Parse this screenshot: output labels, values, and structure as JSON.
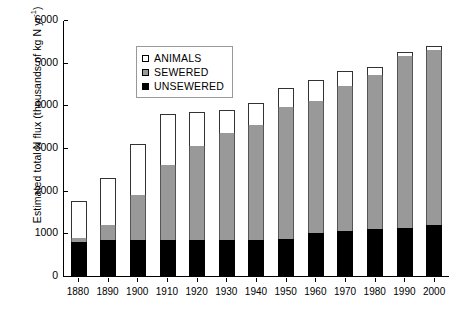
{
  "chart_data": {
    "type": "bar",
    "stacked": true,
    "title": "",
    "xlabel": "",
    "ylabel_text": "Estimated total N flux (thousands of kg N yr",
    "ylabel_sup": "-1",
    "ylabel_tail": ")",
    "categories": [
      "1880",
      "1890",
      "1900",
      "1910",
      "1920",
      "1930",
      "1940",
      "1950",
      "1960",
      "1970",
      "1980",
      "1990",
      "2000"
    ],
    "ylim": [
      0,
      6000
    ],
    "yticks": [
      0,
      1000,
      2000,
      3000,
      4000,
      5000,
      6000
    ],
    "ytick_labels": [
      "0",
      "1000",
      "2000",
      "3000",
      "4000",
      "5000",
      "6000"
    ],
    "grid": false,
    "legend_position": "upper-left",
    "series": [
      {
        "name": "UNSEWERED",
        "color": "#000000",
        "values": [
          800,
          850,
          850,
          850,
          850,
          850,
          850,
          870,
          1000,
          1050,
          1100,
          1120,
          1200
        ]
      },
      {
        "name": "SEWERED",
        "color": "#999999",
        "values": [
          100,
          350,
          1050,
          1750,
          2200,
          2500,
          2700,
          3080,
          3100,
          3400,
          3600,
          4030,
          4100
        ]
      },
      {
        "name": "ANIMALS",
        "color": "#ffffff",
        "values": [
          850,
          1100,
          1200,
          1200,
          800,
          550,
          500,
          450,
          500,
          350,
          200,
          100,
          100
        ]
      }
    ],
    "totals": [
      1750,
      2300,
      3100,
      3800,
      3850,
      3900,
      4050,
      4400,
      4600,
      4800,
      4900,
      5250,
      5400
    ]
  },
  "legend": {
    "items": [
      {
        "label": "ANIMALS",
        "swatch": "white-square-icon"
      },
      {
        "label": "SEWERED",
        "swatch": "gray-square-icon"
      },
      {
        "label": "UNSEWERED",
        "swatch": "black-square-icon"
      }
    ]
  },
  "colors": {
    "animals": "#ffffff",
    "sewered": "#999999",
    "unsewered": "#000000",
    "axis": "#000000",
    "background": "#ffffff"
  }
}
